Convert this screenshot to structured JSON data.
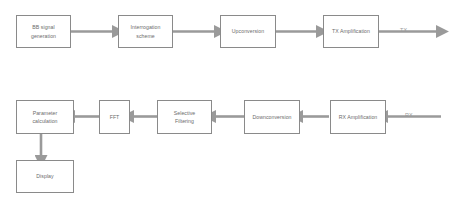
{
  "diagram": {
    "colors": {
      "box_border": "#8a8a8a",
      "box_fill": "#ffffff",
      "text": "#6b6b6b",
      "arrow": "#9a9a9a",
      "page_background": "#ffffff"
    },
    "transmit_chain": {
      "blocks": [
        {
          "id": "bb-signal-generation",
          "label": "BB signal\ngeneration"
        },
        {
          "id": "interrogation-scheme",
          "label": "Interrogation\nscheme"
        },
        {
          "id": "upconversion",
          "label": "Upconversion"
        },
        {
          "id": "tx-amplification",
          "label": "TX Amplification"
        }
      ],
      "output_port": "TX",
      "flow_direction": "left-to-right"
    },
    "receive_chain": {
      "blocks": [
        {
          "id": "rx-amplification",
          "label": "RX Amplification"
        },
        {
          "id": "downconversion",
          "label": "Downconversion"
        },
        {
          "id": "selective-filtering",
          "label": "Selective\nFiltering"
        },
        {
          "id": "fft",
          "label": "FFT"
        },
        {
          "id": "parameter-calculation",
          "label": "Parameter\ncalculation"
        }
      ],
      "input_port": "RX",
      "flow_direction": "right-to-left"
    },
    "output_chain": {
      "blocks": [
        {
          "id": "display",
          "label": "Display"
        }
      ],
      "flow_direction": "top-to-bottom"
    }
  }
}
